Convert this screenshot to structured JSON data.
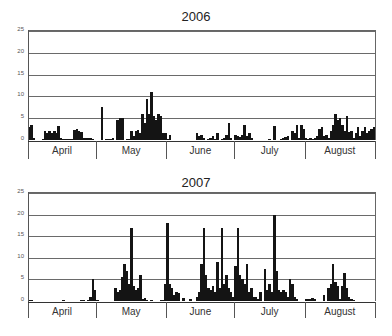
{
  "chart_data": [
    {
      "type": "bar",
      "title": "2006",
      "xlabel": "",
      "ylabel": "",
      "ylim": [
        0,
        25
      ],
      "yticks": [
        0,
        5,
        10,
        15,
        20,
        25
      ],
      "grid": true,
      "months": [
        "April",
        "May",
        "June",
        "July",
        "August"
      ],
      "month_days": [
        30,
        31,
        30,
        31,
        31
      ],
      "values": [
        3,
        3.5,
        0.5,
        0,
        0,
        0,
        0.3,
        2,
        1.5,
        2,
        1.5,
        2,
        1.5,
        3.3,
        0.5,
        0.3,
        0.3,
        0.2,
        0.3,
        0.3,
        2.2,
        2.5,
        2,
        1.8,
        0.5,
        0.5,
        0.5,
        0.5,
        0.2,
        0,
        0,
        0,
        7.5,
        0,
        0.3,
        0.3,
        0.3,
        0.5,
        0,
        4.5,
        5,
        5,
        0,
        0.2,
        0.2,
        2,
        1,
        2,
        2.2,
        1.5,
        6,
        4,
        9.5,
        6,
        11,
        5.5,
        4.5,
        6,
        5.5,
        1.5,
        1.5,
        0.3,
        1.2,
        0,
        0,
        0,
        0,
        0,
        0,
        0,
        0,
        0,
        0,
        0,
        1.5,
        1,
        1.2,
        0.5,
        0,
        0.3,
        0.5,
        1,
        0.2,
        1.5,
        0,
        0.3,
        0.5,
        1.2,
        4,
        0.5,
        0,
        1.2,
        1,
        0.8,
        1.2,
        3.5,
        1,
        1.5,
        0.5,
        0,
        0,
        0,
        0,
        0,
        0,
        0,
        0.2,
        0,
        3.2,
        0,
        0,
        0.3,
        0.5,
        0.8,
        1,
        0,
        2,
        1.5,
        3.5,
        0.5,
        3.5,
        2.5,
        0.5,
        0.3,
        0.5,
        0.2,
        0.5,
        1,
        2.5,
        3,
        1,
        1.2,
        0.5,
        2,
        3.5,
        6,
        4.5,
        5,
        3.5,
        2,
        5.5,
        1.8,
        2,
        0.5,
        1.5,
        3,
        1,
        2,
        3,
        1.5,
        2,
        2.5,
        3
      ]
    },
    {
      "type": "bar",
      "title": "2007",
      "xlabel": "",
      "ylabel": "",
      "ylim": [
        0,
        25
      ],
      "yticks": [
        0,
        5,
        10,
        15,
        20,
        25
      ],
      "grid": true,
      "months": [
        "April",
        "May",
        "June",
        "July",
        "August"
      ],
      "month_days": [
        30,
        31,
        30,
        31,
        31
      ],
      "values": [
        0.2,
        0.2,
        0,
        0,
        0,
        0,
        0,
        0,
        0,
        0,
        0,
        0,
        0,
        0,
        0,
        0.2,
        0,
        0,
        0,
        0,
        0,
        0,
        0,
        0.2,
        0.3,
        0,
        0.3,
        1,
        5,
        2.5,
        0.3,
        0,
        0,
        0,
        0,
        0,
        0,
        0,
        3,
        2,
        2.5,
        5.5,
        8.5,
        7,
        4,
        17,
        3.5,
        2.5,
        3,
        6,
        0.5,
        0.8,
        0.3,
        0,
        0.3,
        0,
        0,
        0,
        0.3,
        0.3,
        4,
        18,
        4,
        3,
        1.5,
        2,
        1.8,
        0,
        0.8,
        0,
        0,
        0.5,
        0,
        0,
        1,
        2,
        8.5,
        17,
        6,
        3,
        2.5,
        3.5,
        2,
        9,
        3,
        17,
        4,
        6,
        3,
        2,
        1,
        8,
        17,
        6,
        5,
        4,
        8.5,
        2,
        3,
        1,
        1,
        0.5,
        2,
        0,
        7.5,
        2.5,
        4,
        2,
        20,
        7,
        2.5,
        2,
        2.5,
        2,
        1,
        5,
        4,
        1,
        0.5,
        0,
        0,
        0,
        0.5,
        0.5,
        0.5,
        0.8,
        0.5,
        0,
        0,
        0,
        1.5,
        0,
        3,
        4,
        8.5,
        4.5,
        3.5,
        0.5,
        3.5,
        6.5,
        3,
        1,
        0.5,
        0.3,
        0,
        0,
        0,
        0,
        0,
        0,
        0,
        0,
        0
      ]
    }
  ],
  "panels": {
    "top": {
      "title": "2006"
    },
    "bottom": {
      "title": "2007"
    }
  }
}
